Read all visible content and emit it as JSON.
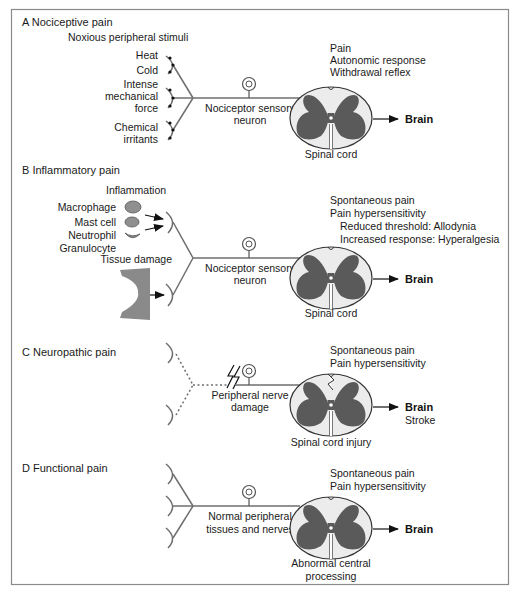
{
  "colors": {
    "frame": "#8a8a8a",
    "nerve": "#6e6e6e",
    "gray_matter": "#5a5a5a",
    "white_matter": "#ececec",
    "cell_fill": "#8f8f8f"
  },
  "panels": [
    {
      "id": "A",
      "title": "A  Nociceptive pain",
      "subtitle": "Noxious peripheral stimuli",
      "stimuli": [
        "Heat",
        "Cold",
        "Intense",
        "mechanical",
        "force",
        "Chemical",
        "irritants"
      ],
      "neuron_label": [
        "Nociceptor sensory",
        "neuron"
      ],
      "outcomes": [
        "Pain",
        "Autonomic response",
        "Withdrawal reflex"
      ],
      "cord_label": [
        "Spinal cord"
      ],
      "brain_label": "Brain",
      "brain_extra": ""
    },
    {
      "id": "B",
      "title": "B  Inflammatory pain",
      "subtitle": "Inflammation",
      "stimuli": [
        "Macrophage",
        "Mast cell",
        "Neutrophil",
        "Granulocyte",
        "Tissue damage"
      ],
      "neuron_label": [
        "Nociceptor sensory",
        "neuron"
      ],
      "outcomes": [
        "Spontaneous pain",
        "Pain hypersensitivity",
        "Reduced threshold: Allodynia",
        "Increased response: Hyperalgesia"
      ],
      "cord_label": [
        "Spinal cord"
      ],
      "brain_label": "Brain",
      "brain_extra": ""
    },
    {
      "id": "C",
      "title": "C  Neuropathic pain",
      "subtitle": "",
      "stimuli": [],
      "neuron_label": [
        "Peripheral nerve",
        "damage"
      ],
      "outcomes": [
        "Spontaneous pain",
        "Pain hypersensitivity"
      ],
      "cord_label": [
        "Spinal cord injury"
      ],
      "brain_label": "Brain",
      "brain_extra": "Stroke"
    },
    {
      "id": "D",
      "title": "D  Functional pain",
      "subtitle": "",
      "stimuli": [],
      "neuron_label": [
        "Normal peripheral",
        "tissues and nerves"
      ],
      "outcomes": [
        "Spontaneous pain",
        "Pain hypersensitivity"
      ],
      "cord_label": [
        "Abnormal central",
        "processing"
      ],
      "brain_label": "Brain",
      "brain_extra": ""
    }
  ]
}
